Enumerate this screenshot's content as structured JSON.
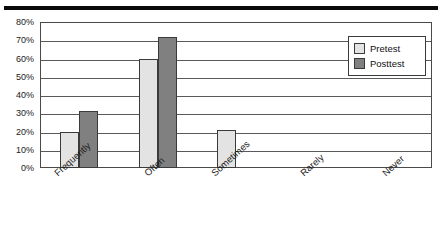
{
  "chart_data": {
    "type": "bar",
    "title": "",
    "xlabel": "",
    "ylabel": "",
    "categories": [
      "Frequently",
      "Often",
      "Sometimes",
      "Rarely",
      "Never"
    ],
    "series": [
      {
        "name": "Pretest",
        "color": "#e3e3e3",
        "values": [
          20,
          60,
          21,
          0,
          0
        ]
      },
      {
        "name": "Posttest",
        "color": "#808080",
        "values": [
          31,
          72,
          0,
          0,
          0
        ]
      }
    ],
    "ylim": [
      0,
      80
    ],
    "ytick_values": [
      0,
      10,
      20,
      30,
      40,
      50,
      60,
      70,
      80
    ],
    "ytick_labels": [
      "0%",
      "10%",
      "20%",
      "30%",
      "40%",
      "50%",
      "60%",
      "70%",
      "80%"
    ],
    "grid": true,
    "legend_position": "top-right",
    "legend_entries": [
      "Pretest",
      "Posttest"
    ]
  },
  "axes": {
    "y": {
      "labels": [
        "80%",
        "70%",
        "60%",
        "50%",
        "40%",
        "30%",
        "20%",
        "10%",
        "0%"
      ]
    },
    "x": {
      "labels": [
        "Frequently",
        "Often",
        "Sometimes",
        "Rarely",
        "Never"
      ]
    }
  },
  "legend": {
    "rows": [
      {
        "label": "Pretest",
        "swatch": "light-gray-swatch-icon"
      },
      {
        "label": "Posttest",
        "swatch": "dark-gray-swatch-icon"
      }
    ]
  },
  "colors": {
    "pretest": "#e3e3e3",
    "posttest": "#808080",
    "frame": "#4a4a4a",
    "rule": "#0a0a0a"
  }
}
